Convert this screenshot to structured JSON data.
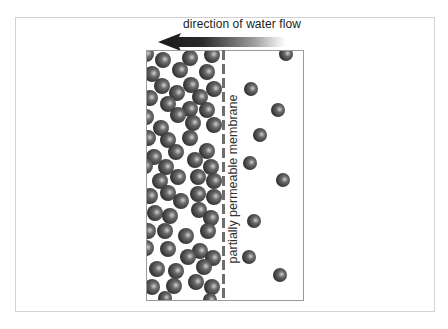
{
  "diagram": {
    "title": "direction of water flow",
    "membrane_label": "partially permeable membrane",
    "arrow": {
      "direction": "left",
      "icon": "arrow-left-icon",
      "color": "#222222"
    },
    "colors": {
      "sphere": "#3a3a3a",
      "sphere_highlight": "#c8c8c8",
      "membrane": "#6e6e6e",
      "frame": "#d2d2d2",
      "box": "#9a9a9a"
    },
    "regions": [
      {
        "name": "concentrated-side",
        "description": "densely packed particles",
        "side": "left"
      },
      {
        "name": "dilute-side",
        "description": "sparse particles",
        "side": "right"
      }
    ]
  }
}
